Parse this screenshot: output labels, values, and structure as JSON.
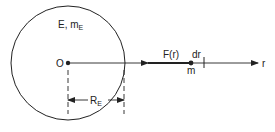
{
  "diagram": {
    "earth_label": "E, m",
    "earth_label_sub": "E",
    "origin_label": "O",
    "force_label": "F(r)",
    "dr_label": "dr",
    "mass_label": "m",
    "axis_label": "r",
    "radius_label": "R",
    "radius_label_sub": "E"
  },
  "colors": {
    "stroke": "#222222",
    "background": "#ffffff"
  }
}
